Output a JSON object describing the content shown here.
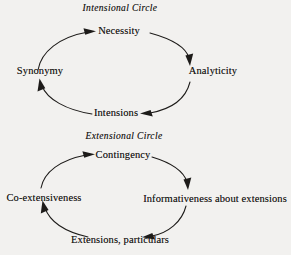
{
  "figure": {
    "background_color": "#f2f1ef",
    "ink_color": "#1d1b19",
    "type": "cycle-diagram-pair"
  },
  "diagrams": [
    {
      "id": "intensional",
      "title": "Intensional Circle",
      "direction": "clockwise",
      "nodes": [
        {
          "id": "necessity",
          "label": "Necessity",
          "position": "top"
        },
        {
          "id": "analyticity",
          "label": "Analyticity",
          "position": "right"
        },
        {
          "id": "intensions",
          "label": "Intensions",
          "position": "bottom"
        },
        {
          "id": "synonymy",
          "label": "Synonymy",
          "position": "left"
        }
      ],
      "edges": [
        {
          "from": "synonymy",
          "to": "necessity"
        },
        {
          "from": "necessity",
          "to": "analyticity"
        },
        {
          "from": "analyticity",
          "to": "intensions"
        },
        {
          "from": "intensions",
          "to": "synonymy"
        }
      ]
    },
    {
      "id": "extensional",
      "title": "Extensional Circle",
      "direction": "clockwise",
      "nodes": [
        {
          "id": "contingency",
          "label": "Contingency",
          "position": "top"
        },
        {
          "id": "informativeness",
          "label": "Informativeness about extensions",
          "position": "right"
        },
        {
          "id": "extensions",
          "label": "Extensions, particulars",
          "position": "bottom"
        },
        {
          "id": "coextensiveness",
          "label": "Co-extensiveness",
          "position": "left"
        }
      ],
      "edges": [
        {
          "from": "coextensiveness",
          "to": "contingency"
        },
        {
          "from": "contingency",
          "to": "informativeness"
        },
        {
          "from": "informativeness",
          "to": "extensions"
        },
        {
          "from": "extensions",
          "to": "coextensiveness"
        }
      ]
    }
  ]
}
